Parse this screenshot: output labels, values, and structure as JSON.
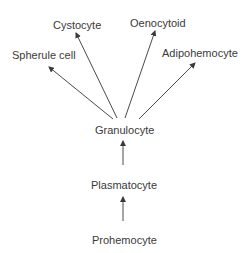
{
  "diagram": {
    "nodes": [
      {
        "id": "cystocyte",
        "label": "Cystocyte",
        "x": 53,
        "y": 19
      },
      {
        "id": "oenocytoid",
        "label": "Oenocytoid",
        "x": 130,
        "y": 17
      },
      {
        "id": "spherule",
        "label": "Spherule cell",
        "x": 12,
        "y": 49
      },
      {
        "id": "adipohemocyte",
        "label": "Adipohemocyte",
        "x": 162,
        "y": 47
      },
      {
        "id": "granulocyte",
        "label": "Granulocyte",
        "x": 95,
        "y": 124
      },
      {
        "id": "plasmatocyte",
        "label": "Plasmatocyte",
        "x": 91,
        "y": 179
      },
      {
        "id": "prohemocyte",
        "label": "Prohemocyte",
        "x": 92,
        "y": 234
      }
    ],
    "edges": [
      {
        "from": "prohemocyte",
        "to": "plasmatocyte"
      },
      {
        "from": "plasmatocyte",
        "to": "granulocyte"
      },
      {
        "from": "granulocyte",
        "to": "spherule"
      },
      {
        "from": "granulocyte",
        "to": "cystocyte"
      },
      {
        "from": "granulocyte",
        "to": "oenocytoid"
      },
      {
        "from": "granulocyte",
        "to": "adipohemocyte"
      }
    ],
    "colors": {
      "line": "#4a4a4a",
      "text": "#3a3a3a"
    }
  }
}
